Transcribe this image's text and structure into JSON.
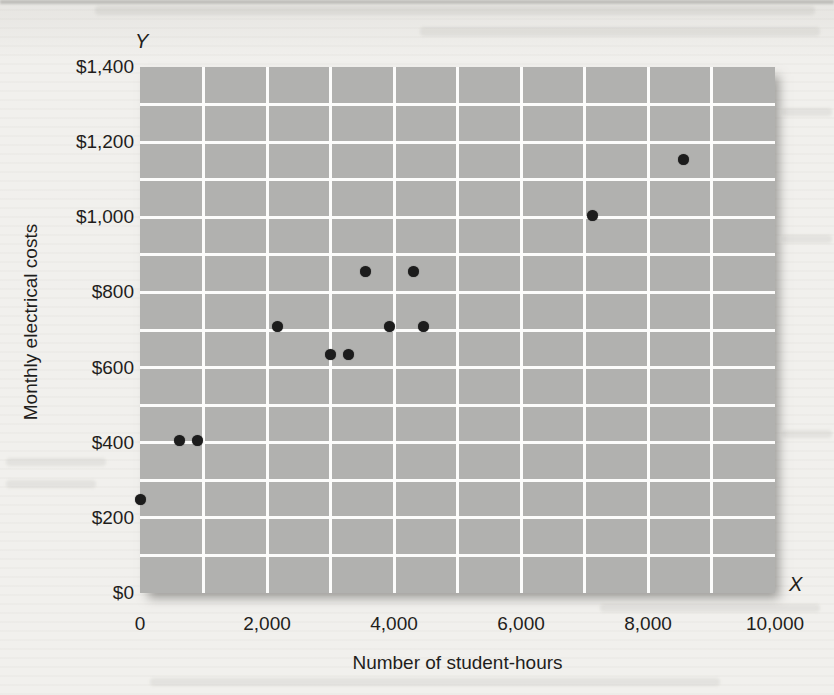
{
  "chart_data": {
    "type": "scatter",
    "title": "",
    "xlabel": "Number of student-hours",
    "ylabel": "Monthly electrical costs",
    "x_axis_letter": "X",
    "y_axis_letter": "Y",
    "xlim": [
      0,
      10000
    ],
    "ylim": [
      0,
      1400
    ],
    "x_tick_values": [
      0,
      2000,
      4000,
      6000,
      8000,
      10000
    ],
    "x_tick_labels": [
      "0",
      "2,000",
      "4,000",
      "6,000",
      "8,000",
      "10,000"
    ],
    "y_tick_values": [
      0,
      200,
      400,
      600,
      800,
      1000,
      1200,
      1400
    ],
    "y_tick_labels": [
      "$0",
      "$200",
      "$400",
      "$600",
      "$800",
      "$1,000",
      "$1,200",
      "$1,400"
    ],
    "grid": {
      "on": true,
      "minor_x_step": 1000,
      "minor_y_step": 100,
      "color": "#fcfcfb"
    },
    "legend": "none",
    "plot_bg_color": "#b1b1af",
    "point_color": "#1c1c1c",
    "points": [
      {
        "x": 0,
        "y": 250
      },
      {
        "x": 620,
        "y": 405
      },
      {
        "x": 900,
        "y": 405
      },
      {
        "x": 2170,
        "y": 710
      },
      {
        "x": 3000,
        "y": 635
      },
      {
        "x": 3290,
        "y": 635
      },
      {
        "x": 3545,
        "y": 855
      },
      {
        "x": 3925,
        "y": 710
      },
      {
        "x": 4300,
        "y": 855
      },
      {
        "x": 4460,
        "y": 710
      },
      {
        "x": 7130,
        "y": 1005
      },
      {
        "x": 8560,
        "y": 1155
      }
    ]
  }
}
